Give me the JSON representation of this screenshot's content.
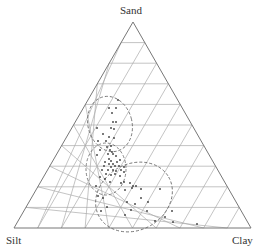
{
  "labels": {
    "top": "Sand",
    "left": "Silt",
    "right": "Clay"
  },
  "colors": {
    "frame": "#777777",
    "grid": "#aaaaaa",
    "ellipse": "#666666",
    "point": "#333333"
  },
  "chart_data": {
    "type": "scatter",
    "subtype": "ternary",
    "title": "",
    "vertices": {
      "top": "Sand",
      "bottom_left": "Silt",
      "bottom_right": "Clay"
    },
    "grid_divisions": 10,
    "groups": [
      {
        "name": "upper-ellipse",
        "center_px": [
          110,
          124
        ],
        "rx": 22,
        "ry": 28,
        "rotate": -15
      },
      {
        "name": "middle-ellipse",
        "center_px": [
          106,
          169
        ],
        "rx": 20,
        "ry": 26,
        "rotate": 0
      },
      {
        "name": "lower-ellipse",
        "center_px": [
          134,
          197
        ],
        "rx": 40,
        "ry": 33,
        "rotate": -30
      }
    ],
    "points_px": [
      [
        118,
        100
      ],
      [
        109,
        108
      ],
      [
        116,
        108
      ],
      [
        112,
        113
      ],
      [
        113,
        122
      ],
      [
        116,
        122
      ],
      [
        111,
        128
      ],
      [
        114,
        129
      ],
      [
        97,
        128
      ],
      [
        103,
        134
      ],
      [
        109,
        137
      ],
      [
        114,
        138
      ],
      [
        98,
        141
      ],
      [
        106,
        141
      ],
      [
        111,
        146
      ],
      [
        107,
        147
      ],
      [
        110,
        150
      ],
      [
        112,
        152
      ],
      [
        100,
        150
      ],
      [
        97,
        155
      ],
      [
        108,
        154
      ],
      [
        113,
        154
      ],
      [
        116,
        156
      ],
      [
        109,
        159
      ],
      [
        111,
        161
      ],
      [
        105,
        162
      ],
      [
        109,
        164
      ],
      [
        113,
        164
      ],
      [
        117,
        162
      ],
      [
        120,
        160
      ],
      [
        104,
        166
      ],
      [
        111,
        167
      ],
      [
        115,
        166
      ],
      [
        119,
        166
      ],
      [
        108,
        170
      ],
      [
        113,
        170
      ],
      [
        116,
        171
      ],
      [
        121,
        170
      ],
      [
        124,
        167
      ],
      [
        102,
        170
      ],
      [
        106,
        174
      ],
      [
        111,
        175
      ],
      [
        115,
        174
      ],
      [
        100,
        177
      ],
      [
        105,
        179
      ],
      [
        110,
        182
      ],
      [
        120,
        176
      ],
      [
        124,
        172
      ],
      [
        121,
        183
      ],
      [
        124,
        182
      ],
      [
        130,
        183
      ],
      [
        133,
        186
      ],
      [
        136,
        186
      ],
      [
        132,
        188
      ],
      [
        141,
        189
      ],
      [
        125,
        190
      ],
      [
        96,
        186
      ],
      [
        98,
        196
      ],
      [
        103,
        198
      ],
      [
        107,
        207
      ],
      [
        101,
        211
      ],
      [
        127,
        202
      ],
      [
        135,
        204
      ],
      [
        131,
        210
      ],
      [
        148,
        202
      ],
      [
        147,
        211
      ],
      [
        172,
        211
      ],
      [
        173,
        222
      ],
      [
        125,
        215
      ],
      [
        165,
        217
      ],
      [
        155,
        221
      ],
      [
        197,
        224
      ],
      [
        141,
        198
      ],
      [
        160,
        189
      ]
    ]
  }
}
